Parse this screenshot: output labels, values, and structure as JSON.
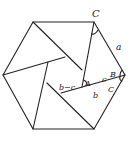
{
  "diagram": {
    "type": "geometry",
    "stroke_color": "#222222",
    "background": "#ffffff",
    "labels": {
      "top_vertex": "C",
      "side": "a",
      "angle_a": "A",
      "seg_bc": "b−c",
      "seg_c": "c",
      "angle_b": "B",
      "angle_c": "C",
      "seg_b": "b"
    }
  }
}
